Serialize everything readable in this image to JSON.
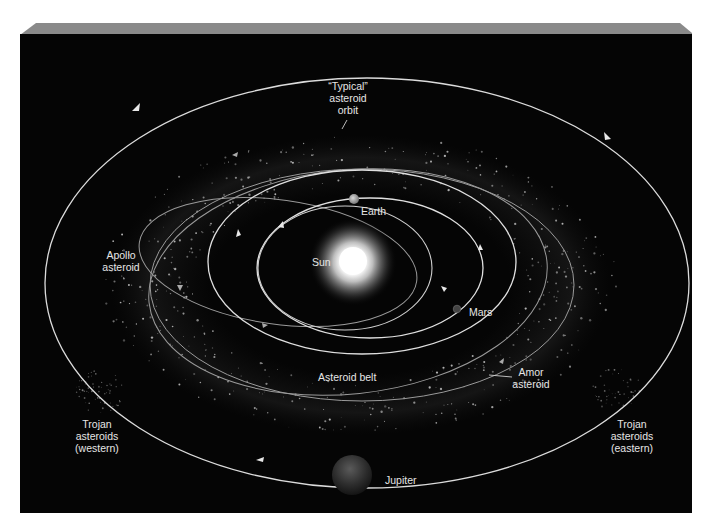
{
  "diagram": {
    "colors": {
      "background": "#050505",
      "panel_top_bevel": "#8a8a8a",
      "orbit_line": "#d8d8d8",
      "asteroid_orbit_line": "#9a9a9a",
      "label_text": "#e6e6e6",
      "sun_core": "#ffffff",
      "sun_glow": "#cfcfcf",
      "earth": "#a8a8a8",
      "mars": "#555555",
      "jupiter": "#3a3a3a"
    },
    "bodies": {
      "sun": {
        "label": "Sun"
      },
      "earth": {
        "label": "Earth"
      },
      "mars": {
        "label": "Mars"
      },
      "jupiter": {
        "label": "Jupiter"
      }
    },
    "labels": {
      "typical_orbit": [
        "“Typical”",
        "asteroid",
        "orbit"
      ],
      "apollo": [
        "Apollo",
        "asteroid"
      ],
      "amor": [
        "Amor",
        "asteroid"
      ],
      "asteroid_belt": "Asteroid belt",
      "trojan_western": [
        "Trojan",
        "asteroids",
        "(western)"
      ],
      "trojan_eastern": [
        "Trojan",
        "asteroids",
        "(eastern)"
      ]
    },
    "orbits": [
      {
        "name": "inner-planet-orbit",
        "direction": "counterclockwise"
      },
      {
        "name": "earth-orbit",
        "direction": "counterclockwise"
      },
      {
        "name": "mars-orbit",
        "direction": "counterclockwise"
      },
      {
        "name": "typical-asteroid-orbit",
        "direction": "counterclockwise"
      },
      {
        "name": "apollo-asteroid-orbit",
        "direction": "counterclockwise"
      },
      {
        "name": "amor-asteroid-orbit",
        "direction": "counterclockwise"
      },
      {
        "name": "jupiter-orbit",
        "direction": "counterclockwise"
      }
    ]
  }
}
